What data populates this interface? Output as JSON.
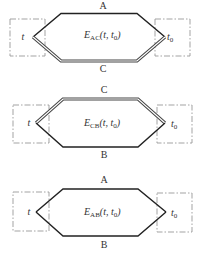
{
  "diagrams": [
    {
      "id": "AC",
      "top_label": "A",
      "bottom_label": "C",
      "emf_symbol": "E",
      "emf_subscript": "AC",
      "emf_args": "(t, t",
      "emf_args_sub": "0",
      "emf_args_close": ")",
      "left_junction": "t",
      "right_junction": "t",
      "right_junction_sub": "0",
      "double_line": "bottom"
    },
    {
      "id": "CB",
      "top_label": "C",
      "bottom_label": "B",
      "emf_symbol": "E",
      "emf_subscript": "CB",
      "emf_args": "(t, t",
      "emf_args_sub": "0",
      "emf_args_close": ")",
      "left_junction": "t",
      "right_junction": "t",
      "right_junction_sub": "0",
      "double_line": "top"
    },
    {
      "id": "AB",
      "top_label": "A",
      "bottom_label": "B",
      "emf_symbol": "E",
      "emf_subscript": "AB",
      "emf_args": "(t, t",
      "emf_args_sub": "0",
      "emf_args_close": ")",
      "left_junction": "t",
      "right_junction": "t",
      "right_junction_sub": "0",
      "double_line": "none"
    }
  ]
}
